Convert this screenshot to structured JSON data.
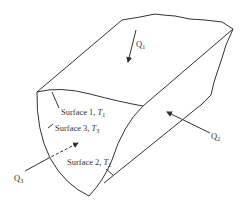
{
  "figure": {
    "surfaces": [
      {
        "name": "Surface 1",
        "temp_symbol": "T",
        "temp_index": "1"
      },
      {
        "name": "Surface 3",
        "temp_symbol": "T",
        "temp_index": "3"
      },
      {
        "name": "Surface 2",
        "temp_symbol": "T",
        "temp_index": "2"
      }
    ],
    "heat_flows": [
      {
        "symbol": "Q",
        "index": "1",
        "style": "solid"
      },
      {
        "symbol": "Q",
        "index": "2",
        "style": "solid"
      },
      {
        "symbol": "Q",
        "index": "3",
        "style": "dashed"
      }
    ],
    "colors": {
      "line": "#333333",
      "background": "#ffffff"
    }
  }
}
